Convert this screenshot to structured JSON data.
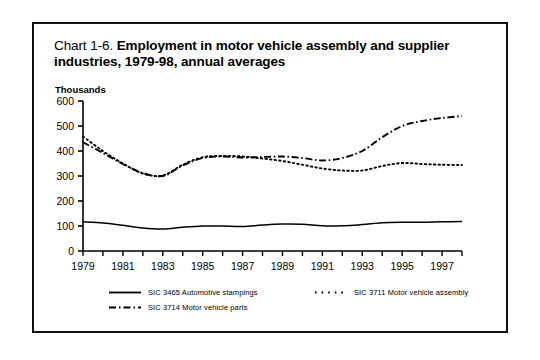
{
  "chart_data": {
    "type": "line",
    "title": "Chart 1-6. Employment in motor vehicle assembly and supplier industries, 1979-98, annual averages",
    "title_lead": "Chart 1-6.",
    "title_bold": "Employment in motor vehicle assembly and supplier industries, 1979-98, annual averages",
    "ylabel": "Thousands",
    "xlabel": "",
    "ylim": [
      0,
      600
    ],
    "ytick_values": [
      0,
      100,
      200,
      300,
      400,
      500,
      600
    ],
    "ytick_labels": [
      "0",
      "100",
      "200",
      "300",
      "400",
      "500",
      "600"
    ],
    "xlim": [
      1979,
      1998
    ],
    "x": [
      1979,
      1980,
      1981,
      1982,
      1983,
      1984,
      1985,
      1986,
      1987,
      1988,
      1989,
      1990,
      1991,
      1992,
      1993,
      1994,
      1995,
      1996,
      1997,
      1998
    ],
    "xtick_values": [
      1979,
      1980,
      1981,
      1982,
      1983,
      1984,
      1985,
      1986,
      1987,
      1988,
      1989,
      1990,
      1991,
      1992,
      1993,
      1994,
      1995,
      1996,
      1997,
      1998
    ],
    "xtick_labels": [
      "1979",
      "",
      "1981",
      "",
      "1983",
      "",
      "1985",
      "",
      "1987",
      "",
      "1989",
      "",
      "1991",
      "",
      "1993",
      "",
      "1995",
      "",
      "1997",
      ""
    ],
    "grid": false,
    "legend_position": "bottom",
    "series": [
      {
        "name": "SIC 3465 Automotive stampings",
        "key": "solid",
        "style": "solid",
        "color": "#000000",
        "values": [
          117,
          112,
          103,
          92,
          88,
          95,
          100,
          100,
          98,
          104,
          108,
          107,
          101,
          101,
          106,
          113,
          115,
          115,
          117,
          118
        ]
      },
      {
        "name": "SIC 3711 Motor vehicle assembly",
        "key": "dotted",
        "style": "dotted",
        "color": "#000000",
        "values": [
          458,
          400,
          350,
          310,
          302,
          345,
          375,
          380,
          378,
          370,
          360,
          345,
          330,
          322,
          322,
          340,
          352,
          348,
          345,
          344
        ]
      },
      {
        "name": "SIC 3714 Motor vehicle parts",
        "key": "dashdot",
        "style": "dashdot",
        "color": "#000000",
        "values": [
          435,
          392,
          348,
          312,
          300,
          342,
          372,
          378,
          374,
          376,
          378,
          372,
          362,
          372,
          400,
          455,
          500,
          520,
          532,
          540
        ]
      }
    ]
  },
  "legend": {
    "items": [
      {
        "label": "SIC 3465 Automotive stampings",
        "style": "solid"
      },
      {
        "label": "SIC 3711 Motor vehicle assembly",
        "style": "dotted"
      },
      {
        "label": "SIC 3714 Motor vehicle parts",
        "style": "dashdot"
      }
    ]
  }
}
